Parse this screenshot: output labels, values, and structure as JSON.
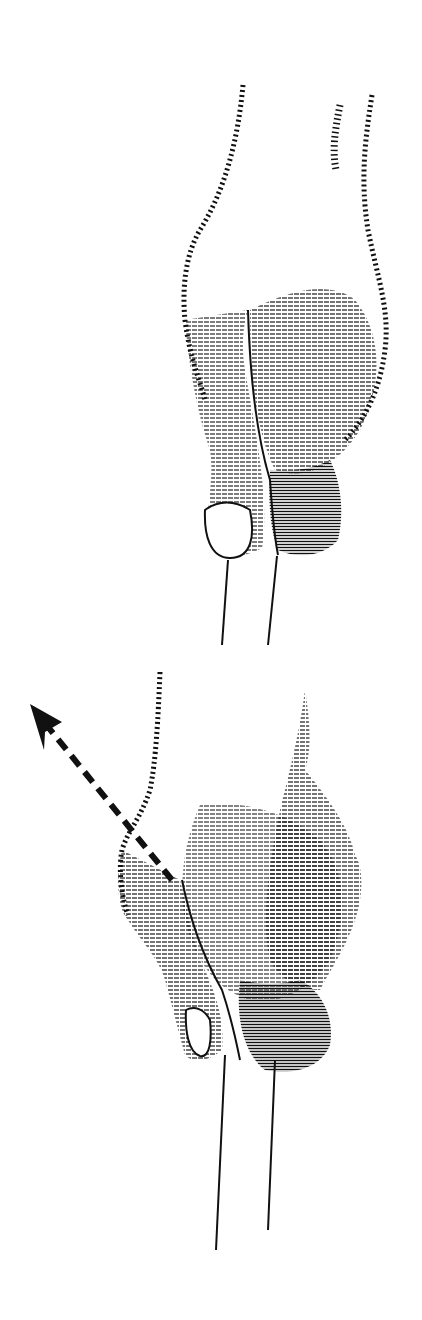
{
  "illustration": {
    "style": "engraving",
    "ink_color": "#111111",
    "paper_color": "#ffffff",
    "figures": [
      {
        "id": "top",
        "subject": "hand-gripping-drumstick",
        "view": "back-of-hand, relaxed"
      },
      {
        "id": "bottom",
        "subject": "hand-gripping-drumstick",
        "view": "wrist-turned, motion",
        "annotation": "dashed-arrow-up-left"
      }
    ]
  }
}
